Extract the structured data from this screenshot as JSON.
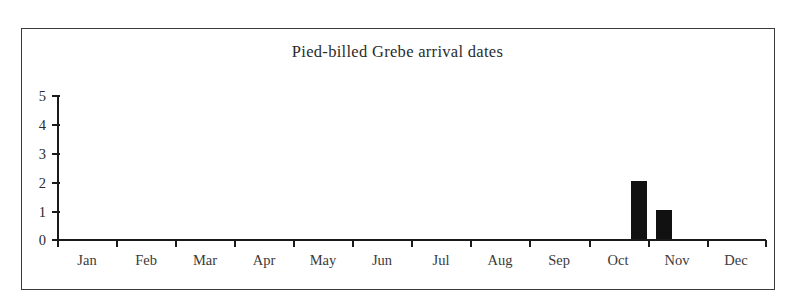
{
  "chart_data": {
    "type": "bar",
    "title": "Pied-billed Grebe arrival dates",
    "xlabel": "",
    "ylabel": "",
    "categories": [
      "Jan",
      "Feb",
      "Mar",
      "Apr",
      "May",
      "Jun",
      "Jul",
      "Aug",
      "Sep",
      "Oct",
      "Nov",
      "Dec"
    ],
    "values": [
      0,
      0,
      0,
      0,
      0,
      0,
      0,
      0,
      0,
      2,
      1,
      0
    ],
    "ylim": [
      0,
      5
    ],
    "yticks": [
      "0",
      "1",
      "2",
      "3",
      "4",
      "5"
    ],
    "grid": false,
    "legend": false,
    "bar_color": "#111111",
    "axis_color": "#1a1a1a",
    "bars": [
      {
        "label": "Oct",
        "value": 2
      },
      {
        "label": "Nov",
        "value": 1
      }
    ]
  },
  "figure": {
    "border_color": "#3a3a3a",
    "background": "#ffffff"
  }
}
